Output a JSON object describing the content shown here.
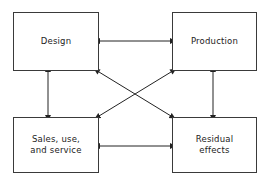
{
  "diagram": {
    "background_color": "#ffffff",
    "line_color": "#222222",
    "border_color": "#3a3a3a",
    "nodes": [
      {
        "id": "design",
        "label": "Design"
      },
      {
        "id": "production",
        "label": "Production"
      },
      {
        "id": "sales",
        "label": "Sales, use,\nand service"
      },
      {
        "id": "residual",
        "label": "Residual\neffects"
      }
    ],
    "connections": [
      {
        "id": "design-production",
        "from": "Design",
        "to": "Production",
        "style": "double-headed arrow",
        "orientation": "horizontal"
      },
      {
        "id": "design-sales",
        "from": "Design",
        "to": "Sales, use, and service",
        "style": "double-headed arrow",
        "orientation": "vertical"
      },
      {
        "id": "production-residual",
        "from": "Production",
        "to": "Residual effects",
        "style": "double-headed arrow",
        "orientation": "vertical"
      },
      {
        "id": "sales-residual",
        "from": "Sales, use, and service",
        "to": "Residual effects",
        "style": "double-headed arrow",
        "orientation": "horizontal"
      },
      {
        "id": "design-residual",
        "from": "Design",
        "to": "Residual effects",
        "style": "double-headed arrow",
        "orientation": "diagonal"
      },
      {
        "id": "production-sales",
        "from": "Production",
        "to": "Sales, use, and service",
        "style": "double-headed arrow",
        "orientation": "diagonal"
      }
    ]
  }
}
